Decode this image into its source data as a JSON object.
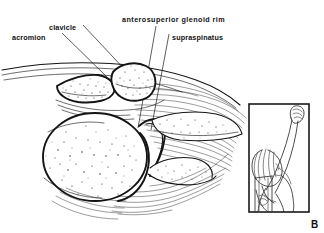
{
  "figure": {
    "panel_letter": "B",
    "type": "anatomical-line-illustration",
    "background_color": "#ffffff",
    "ink_color": "#141414"
  },
  "labels": [
    {
      "id": "acromion",
      "text": "acromion",
      "x": 12,
      "y": 38,
      "leader_from": [
        62,
        33
      ],
      "leader_to": [
        108,
        77
      ]
    },
    {
      "id": "clavicle",
      "text": "clavicle",
      "x": 48,
      "y": 28,
      "leader_from": [
        81,
        24
      ],
      "leader_to": [
        127,
        72
      ]
    },
    {
      "id": "anterosuperior-glenoid-rim",
      "text": "anterosuperior glenoid rim",
      "x": 122,
      "y": 21,
      "leader_from": [
        155,
        26
      ],
      "leader_to": [
        139,
        125
      ]
    },
    {
      "id": "supraspinatus",
      "text": "supraspinatus",
      "x": 172,
      "y": 38,
      "leader_from": [
        168,
        34
      ],
      "leader_to": [
        150,
        128
      ]
    }
  ],
  "inset": {
    "name": "patient-positioning-inset",
    "x": 248,
    "y": 103,
    "width": 62,
    "height": 110,
    "description": "standing figure with arm raised overhead holding cassette"
  }
}
